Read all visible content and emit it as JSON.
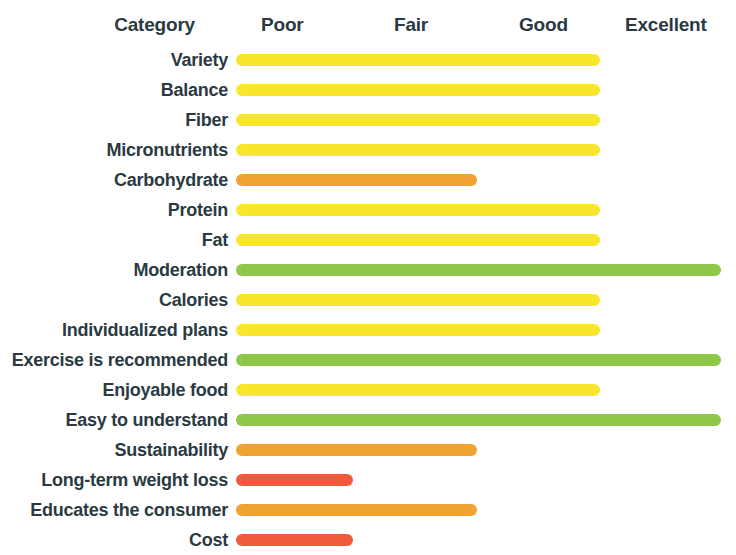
{
  "chart_data": {
    "type": "bar",
    "title": "",
    "xlabel": "",
    "ylabel": "",
    "orientation": "horizontal",
    "grid": false,
    "legend_position": "none",
    "scale_labels": [
      "Poor",
      "Fair",
      "Good",
      "Excellent"
    ],
    "category_header": "Category",
    "scale_min": "Poor",
    "scale_max": "Excellent",
    "xlim": [
      0,
      4
    ],
    "categories": [
      "Variety",
      "Balance",
      "Fiber",
      "Micronutrients",
      "Carbohydrate",
      "Protein",
      "Fat",
      "Moderation",
      "Calories",
      "Individualized plans",
      "Exercise is recommended",
      "Enjoyable food",
      "Easy to understand",
      "Sustainability",
      "Long-term weight loss",
      "Educates the consumer",
      "Cost"
    ],
    "values": [
      3.0,
      3.0,
      3.0,
      3.0,
      2.0,
      3.0,
      3.0,
      4.0,
      3.0,
      3.0,
      4.0,
      3.0,
      4.0,
      2.0,
      1.0,
      2.0,
      1.0
    ],
    "rating_labels": [
      "Good",
      "Good",
      "Good",
      "Good",
      "Fair",
      "Good",
      "Good",
      "Excellent",
      "Good",
      "Good",
      "Excellent",
      "Good",
      "Excellent",
      "Fair",
      "Poor",
      "Fair",
      "Poor"
    ],
    "colors": {
      "poor": "#ef5b3c",
      "fair": "#f0a331",
      "good": "#f7e62b",
      "excellent": "#8fc74a",
      "text": "#2b3a42",
      "background": "#ffffff"
    },
    "bars": [
      {
        "label": "Variety",
        "value": 3.0,
        "rating": "Good",
        "color": "#f7e62b",
        "width_px": 364
      },
      {
        "label": "Balance",
        "value": 3.0,
        "rating": "Good",
        "color": "#f7e62b",
        "width_px": 364
      },
      {
        "label": "Fiber",
        "value": 3.0,
        "rating": "Good",
        "color": "#f7e62b",
        "width_px": 364
      },
      {
        "label": "Micronutrients",
        "value": 3.0,
        "rating": "Good",
        "color": "#f7e62b",
        "width_px": 364
      },
      {
        "label": "Carbohydrate",
        "value": 2.0,
        "rating": "Fair",
        "color": "#f0a331",
        "width_px": 241
      },
      {
        "label": "Protein",
        "value": 3.0,
        "rating": "Good",
        "color": "#f7e62b",
        "width_px": 364
      },
      {
        "label": "Fat",
        "value": 3.0,
        "rating": "Good",
        "color": "#f7e62b",
        "width_px": 364
      },
      {
        "label": "Moderation",
        "value": 4.0,
        "rating": "Excellent",
        "color": "#8fc74a",
        "width_px": 485
      },
      {
        "label": "Calories",
        "value": 3.0,
        "rating": "Good",
        "color": "#f7e62b",
        "width_px": 364
      },
      {
        "label": "Individualized plans",
        "value": 3.0,
        "rating": "Good",
        "color": "#f7e62b",
        "width_px": 364
      },
      {
        "label": "Exercise is recommended",
        "value": 4.0,
        "rating": "Excellent",
        "color": "#8fc74a",
        "width_px": 485
      },
      {
        "label": "Enjoyable food",
        "value": 3.0,
        "rating": "Good",
        "color": "#f7e62b",
        "width_px": 364
      },
      {
        "label": "Easy to understand",
        "value": 4.0,
        "rating": "Excellent",
        "color": "#8fc74a",
        "width_px": 485
      },
      {
        "label": "Sustainability",
        "value": 2.0,
        "rating": "Fair",
        "color": "#f0a331",
        "width_px": 241
      },
      {
        "label": "Long-term weight loss",
        "value": 1.0,
        "rating": "Poor",
        "color": "#ef5b3c",
        "width_px": 117
      },
      {
        "label": "Educates the consumer",
        "value": 2.0,
        "rating": "Fair",
        "color": "#f0a331",
        "width_px": 241
      },
      {
        "label": "Cost",
        "value": 1.0,
        "rating": "Poor",
        "color": "#ef5b3c",
        "width_px": 117
      }
    ]
  }
}
